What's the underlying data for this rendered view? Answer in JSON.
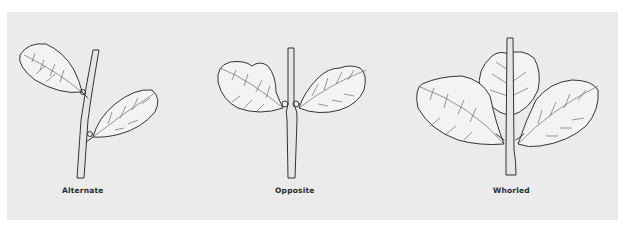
{
  "figure": {
    "panels": [
      {
        "id": "alternate",
        "label": "Alternate"
      },
      {
        "id": "opposite",
        "label": "Opposite"
      },
      {
        "id": "whorled",
        "label": "Whorled"
      }
    ]
  },
  "colors": {
    "page_background": "#ffffff",
    "panel_background": "#ebebeb",
    "ink": "#333333"
  }
}
